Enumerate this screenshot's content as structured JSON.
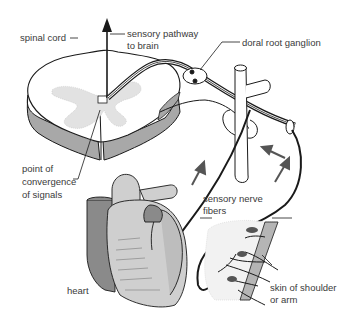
{
  "diagram": {
    "type": "anatomical-illustration",
    "colors": {
      "line": "#1a1a1a",
      "gray_matter": "#dcdcdc",
      "cord_side": "#a8a8a8",
      "heart_light": "#cfcfcf",
      "heart_dark": "#8a8a8a",
      "arrow": "#555555",
      "text": "#3a3a3a"
    },
    "labels": {
      "spinal_cord": "spinal cord",
      "sensory_pathway_line1": "sensory pathway",
      "sensory_pathway_line2": "to brain",
      "dorsal_root_ganglion": "doral root ganglion",
      "point_line1": "point of",
      "point_line2": "convergence",
      "point_line3": "of signals",
      "sensory_nerve_line1": "sensory nerve",
      "sensory_nerve_line2": "fibers",
      "heart": "heart",
      "skin_line1": "skin of shoulder",
      "skin_line2": "or arm"
    }
  }
}
